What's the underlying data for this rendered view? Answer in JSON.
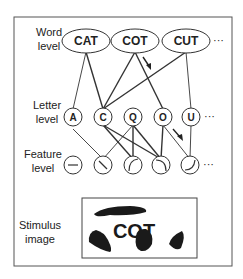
{
  "levels": {
    "word": [
      "Word",
      "level"
    ],
    "letter": [
      "Letter",
      "level"
    ],
    "feature": [
      "Feature",
      "level"
    ],
    "stimulus": [
      "Stimulus",
      "image"
    ]
  },
  "word_nodes": [
    "CAT",
    "COT",
    "CUT"
  ],
  "letter_nodes": [
    "A",
    "C",
    "Q",
    "O",
    "U"
  ],
  "feature_nodes": [
    "horizontal-bar",
    "diagonal-stroke",
    "left-arc",
    "right-arc",
    "bottom-arc"
  ],
  "ellipsis": "···",
  "stimulus_text": "COT",
  "colors": {
    "line": "#333333",
    "frame": "#555555",
    "ink": "#1a1a1a"
  }
}
